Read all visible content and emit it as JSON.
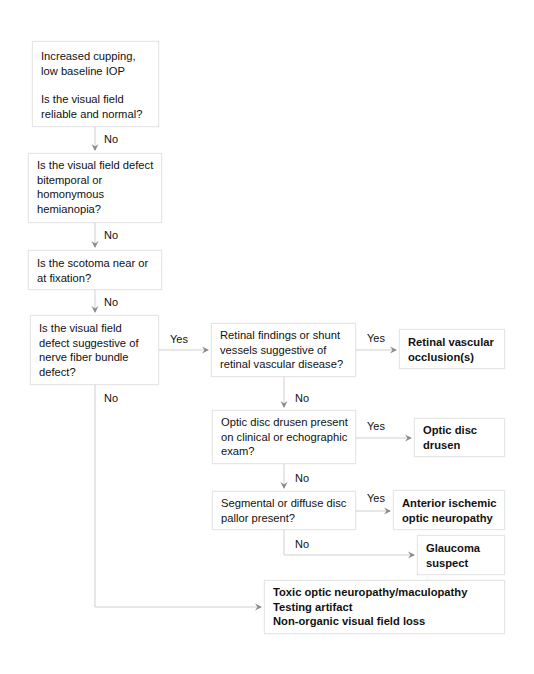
{
  "nodes": {
    "start": {
      "lines": [
        "Increased cupping,",
        "low baseline IOP"
      ],
      "question": [
        "Is the visual field",
        "reliable and normal?"
      ]
    },
    "q_hemianopia": {
      "lines": [
        "Is the visual field defect",
        "bitemporal or",
        "homonymous",
        "hemianopia?"
      ]
    },
    "q_scotoma": {
      "lines": [
        "Is the scotoma near or",
        "at fixation?"
      ]
    },
    "q_nerve_fiber": {
      "lines": [
        "Is the visual field",
        "defect suggestive of",
        "nerve fiber bundle",
        "defect?"
      ]
    },
    "q_retinal": {
      "lines": [
        "Retinal findings or shunt",
        "vessels suggestive of",
        "retinal vascular disease?"
      ]
    },
    "q_drusen": {
      "lines": [
        "Optic disc drusen present",
        "on clinical or echographic",
        "exam?"
      ]
    },
    "q_pallor": {
      "lines": [
        "Segmental or diffuse disc",
        "pallor present?"
      ]
    },
    "out_retinal_occlusion": {
      "lines": [
        "Retinal vascular",
        "occlusion(s)"
      ]
    },
    "out_disc_drusen": {
      "lines": [
        "Optic disc",
        "drusen"
      ]
    },
    "out_aion": {
      "lines": [
        "Anterior ischemic",
        "optic neuropathy"
      ]
    },
    "out_glaucoma_suspect": {
      "lines": [
        "Glaucoma",
        "suspect"
      ]
    },
    "out_other": {
      "lines": [
        "Toxic optic neuropathy/maculopathy",
        "Testing artifact",
        "Non-organic visual field loss"
      ]
    }
  },
  "edge_labels": {
    "start_to_hemianopia": "No",
    "hemianopia_to_scotoma": "No",
    "scotoma_to_nerve_fiber": "No",
    "nerve_fiber_to_retinal": "Yes",
    "nerve_fiber_to_other": "No",
    "retinal_to_occlusion": "Yes",
    "retinal_to_drusen": "No",
    "drusen_to_out_drusen": "Yes",
    "drusen_to_pallor": "No",
    "pallor_to_aion": "Yes",
    "pallor_to_glaucoma": "No"
  },
  "colors": {
    "connector": "#c8c8c8",
    "arrowhead": "#8a8a8a",
    "box_border": "#e6e6e6",
    "text": "#111111"
  }
}
